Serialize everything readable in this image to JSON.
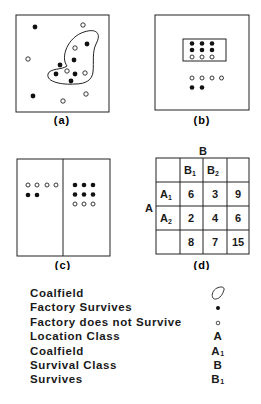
{
  "panels": {
    "a": {
      "label": "(a)"
    },
    "b": {
      "label": "(b)"
    },
    "c": {
      "label": "(c)"
    },
    "d": {
      "label": "(d)",
      "col_header": "B",
      "row_header": "A",
      "columns": [
        "",
        "B1",
        "B2",
        ""
      ],
      "rows": [
        {
          "label": "A1",
          "values": [
            "6",
            "3",
            "9"
          ]
        },
        {
          "label": "A2",
          "values": [
            "2",
            "4",
            "6"
          ]
        },
        {
          "label": "",
          "values": [
            "8",
            "7",
            "15"
          ]
        }
      ]
    }
  },
  "legend": {
    "items": [
      {
        "label": "Coalfield",
        "symbol": "coalfield-outline"
      },
      {
        "label": "Factory Survives",
        "symbol": "•"
      },
      {
        "label": "Factory does not Survive",
        "symbol": "○"
      },
      {
        "label": "Location Class",
        "symbol": "A"
      },
      {
        "label": "Coalfield",
        "symbol": "A1"
      },
      {
        "label": "Survival Class",
        "symbol": "B"
      },
      {
        "label": "Survives",
        "symbol": "B1"
      }
    ]
  }
}
